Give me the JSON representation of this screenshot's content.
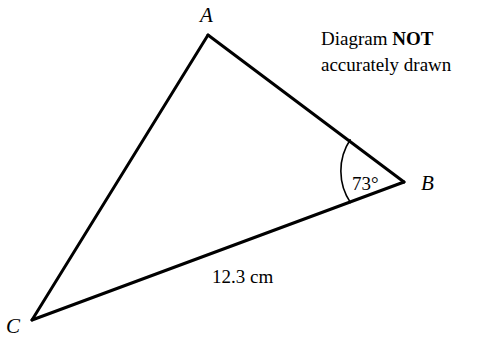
{
  "figure": {
    "type": "geometry-diagram",
    "shape": "triangle",
    "background_color": "#ffffff",
    "stroke_color": "#000000",
    "side_stroke_width": 3,
    "arc_stroke_width": 1.6
  },
  "vertices": [
    {
      "id": "A",
      "label": "A",
      "x": 208,
      "y": 35,
      "label_x": 200,
      "label_y": 22
    },
    {
      "id": "B",
      "label": "B",
      "x": 404,
      "y": 182,
      "label_x": 421,
      "label_y": 190
    },
    {
      "id": "C",
      "label": "C",
      "x": 32,
      "y": 320,
      "label_x": 6,
      "label_y": 333
    }
  ],
  "sides": [
    {
      "id": "AB",
      "from": "A",
      "to": "B",
      "label": ""
    },
    {
      "id": "BC",
      "from": "B",
      "to": "C",
      "label": "12.3 cm"
    },
    {
      "id": "CA",
      "from": "C",
      "to": "A",
      "label": ""
    }
  ],
  "angle": {
    "at_vertex": "B",
    "label": "73°",
    "value": 73,
    "unit": "degrees",
    "arc_radius": 57,
    "label_x": 352,
    "label_y": 190
  },
  "measurement": {
    "label": "12.3 cm",
    "value": 12.3,
    "unit": "cm",
    "side": "BC",
    "label_x": 212,
    "label_y": 283
  },
  "note": {
    "line1_prefix": "Diagram ",
    "line1_emphasis": "NOT",
    "line2": "accurately drawn"
  }
}
